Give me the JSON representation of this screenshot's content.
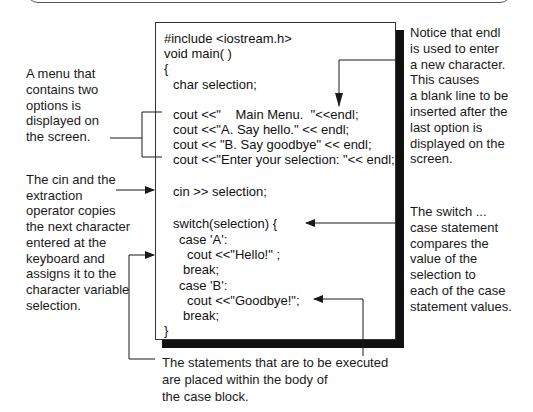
{
  "code_listing": {
    "lines": [
      {
        "text": "#include <iostream.h>",
        "indent": 0,
        "y": 30
      },
      {
        "text": "void main( )",
        "indent": 0,
        "y": 45
      },
      {
        "text": "{",
        "indent": 0,
        "y": 60
      },
      {
        "text": "char selection;",
        "indent": 9,
        "y": 76
      },
      {
        "text": "cout <<\"    Main Menu.  \"<<endl;",
        "indent": 9,
        "y": 106
      },
      {
        "text": "cout <<\"A. Say hello.\" << endl;",
        "indent": 9,
        "y": 121
      },
      {
        "text": "cout << \"B. Say goodbye\" << endl;",
        "indent": 9,
        "y": 136
      },
      {
        "text": "cout <<\"Enter your selection: \"<< endl;",
        "indent": 9,
        "y": 151
      },
      {
        "text": "cin >> selection;",
        "indent": 9,
        "y": 183
      },
      {
        "text": "switch(selection) {",
        "indent": 9,
        "y": 215
      },
      {
        "text": "case 'A':",
        "indent": 15,
        "y": 231
      },
      {
        "text": "cout <<\"Hello!\" ;",
        "indent": 23,
        "y": 246
      },
      {
        "text": "break;",
        "indent": 19,
        "y": 261
      },
      {
        "text": "case 'B':",
        "indent": 15,
        "y": 277
      },
      {
        "text": "cout <<\"Goodbye!\";",
        "indent": 23,
        "y": 292
      },
      {
        "text": "break;",
        "indent": 19,
        "y": 307
      },
      {
        "text": "}",
        "indent": 0,
        "y": 322
      }
    ]
  },
  "annotations": {
    "menu": [
      "A menu that",
      "contains two",
      "options is",
      "displayed on",
      "the screen."
    ],
    "cin": [
      "The cin and the",
      "extraction",
      "operator copies",
      "the next character",
      "entered at the",
      "keyboard and",
      "assigns it to the",
      "character variable",
      "selection."
    ],
    "endl": [
      "Notice that endl",
      "is used to enter",
      "a new character.",
      "This causes",
      "a blank line to be",
      "inserted after the",
      "last option is",
      "displayed on the",
      "screen."
    ],
    "switch": [
      "The switch ...",
      "case statement",
      "compares the",
      "value of the",
      "selection to",
      "each of the case",
      "statement values."
    ],
    "case_block": [
      "The statements  that are to be executed",
      "are placed within the body of",
      "the case block."
    ]
  },
  "colors": {
    "line": "#1a1a1a",
    "shadow": "#111111",
    "text": "#1a1a1a"
  }
}
